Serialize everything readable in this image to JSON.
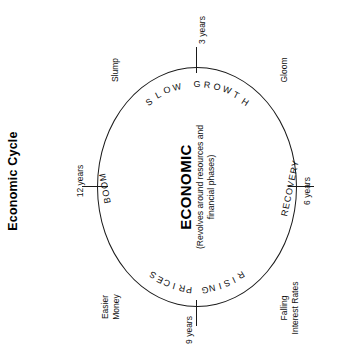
{
  "title": "Economic Cycle",
  "center": {
    "heading": "ECONOMIC",
    "subtitle": "(Revolves around resources and financial phases)"
  },
  "chart_data": {
    "type": "pie",
    "title": "Economic Cycle",
    "subtitle": "(Revolves around resources and financial phases)",
    "legend_position": "none",
    "grid": false,
    "categories": [
      "SLOW GROWTH",
      "RECOVERY",
      "RISING PRICES",
      "BOOM"
    ],
    "values": [
      3,
      3,
      3,
      3
    ],
    "tick_labels": [
      "3 years",
      "6 years",
      "9 years",
      "12 years"
    ],
    "annotations": [
      "Slump",
      "Gloom",
      "Falling Interest Rates",
      "Easier Money"
    ]
  },
  "phases": [
    {
      "name": "slow-growth",
      "label": "SLOW GROWTH",
      "tick": "3 years",
      "position": "top"
    },
    {
      "name": "recovery",
      "label": "RECOVERY",
      "tick": "6 years",
      "position": "right"
    },
    {
      "name": "rising-prices",
      "label": "RISING PRICES",
      "tick": "9 years",
      "position": "bottom"
    },
    {
      "name": "boom",
      "label": "BOOM",
      "tick": "12 years",
      "position": "left"
    }
  ],
  "descriptors": [
    {
      "name": "slump",
      "label": "Slump",
      "position": "top-left"
    },
    {
      "name": "gloom",
      "label": "Gloom",
      "position": "top-right"
    },
    {
      "name": "falling-interest-rates",
      "line1": "Falling",
      "line2": "Interest Rates",
      "position": "bottom-right"
    },
    {
      "name": "easier-money",
      "line1": "Easier",
      "line2": "Money",
      "position": "bottom-left"
    }
  ],
  "colors": {
    "stroke": "#1a1a1a",
    "text": "#111111",
    "background": "#ffffff"
  }
}
